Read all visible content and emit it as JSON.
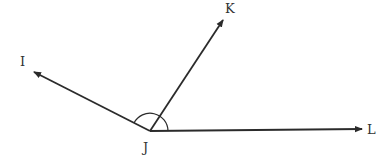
{
  "diagram": {
    "type": "angle-rays",
    "vertex": {
      "label": "J",
      "x": 150,
      "y": 131
    },
    "rays": [
      {
        "name": "ray-JI",
        "from": "J",
        "to": "I",
        "tip": {
          "x": 34,
          "y": 72
        }
      },
      {
        "name": "ray-JK",
        "from": "J",
        "to": "K",
        "tip": {
          "x": 223,
          "y": 20
        }
      },
      {
        "name": "ray-JL",
        "from": "J",
        "to": "L",
        "tip": {
          "x": 362,
          "y": 129
        }
      }
    ],
    "labels": {
      "I": "I",
      "J": "J",
      "K": "K",
      "L": "L"
    },
    "angle_mark": {
      "center": "J",
      "radius": 18,
      "between": [
        "JL",
        "JI"
      ]
    },
    "colors": {
      "line": "#2b2b2b",
      "text": "#333333",
      "background": "#ffffff"
    }
  }
}
